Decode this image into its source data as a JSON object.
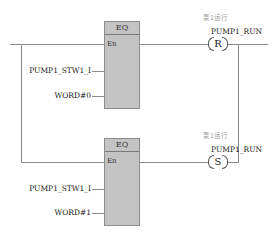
{
  "rung1": {
    "block": {
      "title": "EQ",
      "en_label": "En"
    },
    "inputs": [
      "PUMP1_STW1_I",
      "WORD#0"
    ],
    "coil": {
      "type": "R",
      "variable": "PUMP1_RUN",
      "comment": "泵1运行"
    }
  },
  "rung2": {
    "block": {
      "title": "EQ",
      "en_label": "En"
    },
    "inputs": [
      "PUMP1_STW1_I",
      "WORD#1"
    ],
    "coil": {
      "type": "S",
      "variable": "PUMP1_RUN",
      "comment": "泵1运行"
    }
  },
  "colors": {
    "block_fill": "#c4c4c4",
    "wire": "#8a8a8a",
    "comment": "#999999"
  }
}
